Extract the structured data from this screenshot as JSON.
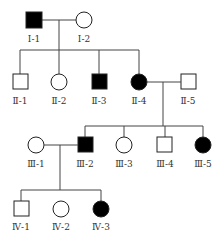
{
  "diagram": {
    "type": "pedigree",
    "colors": {
      "affected": "#000000",
      "unaffected": "#ffffff",
      "line": "#444444"
    },
    "legend": {
      "square": "male",
      "circle": "female",
      "filled": "affected",
      "open": "unaffected"
    },
    "generations": [
      {
        "id": "I",
        "members": [
          {
            "id": "I-1",
            "label": "Ⅰ-1",
            "sex": "male",
            "affected": true
          },
          {
            "id": "I-2",
            "label": "Ⅰ-2",
            "sex": "female",
            "affected": false
          }
        ]
      },
      {
        "id": "II",
        "members": [
          {
            "id": "II-1",
            "label": "Ⅱ-1",
            "sex": "male",
            "affected": false
          },
          {
            "id": "II-2",
            "label": "Ⅱ-2",
            "sex": "female",
            "affected": false
          },
          {
            "id": "II-3",
            "label": "Ⅱ-3",
            "sex": "male",
            "affected": true
          },
          {
            "id": "II-4",
            "label": "Ⅱ-4",
            "sex": "female",
            "affected": true
          },
          {
            "id": "II-5",
            "label": "Ⅱ-5",
            "sex": "male",
            "affected": false
          }
        ]
      },
      {
        "id": "III",
        "members": [
          {
            "id": "III-1",
            "label": "Ⅲ-1",
            "sex": "female",
            "affected": false
          },
          {
            "id": "III-2",
            "label": "Ⅲ-2",
            "sex": "male",
            "affected": true
          },
          {
            "id": "III-3",
            "label": "Ⅲ-3",
            "sex": "female",
            "affected": false
          },
          {
            "id": "III-4",
            "label": "Ⅲ-4",
            "sex": "male",
            "affected": false
          },
          {
            "id": "III-5",
            "label": "Ⅲ-5",
            "sex": "female",
            "affected": true
          }
        ]
      },
      {
        "id": "IV",
        "members": [
          {
            "id": "IV-1",
            "label": "Ⅳ-1",
            "sex": "male",
            "affected": false
          },
          {
            "id": "IV-2",
            "label": "Ⅳ-2",
            "sex": "female",
            "affected": false
          },
          {
            "id": "IV-3",
            "label": "Ⅳ-3",
            "sex": "female",
            "affected": true
          }
        ]
      }
    ],
    "marriages": [
      {
        "partners": [
          "I-1",
          "I-2"
        ],
        "children": [
          "II-1",
          "II-2",
          "II-3",
          "II-4"
        ]
      },
      {
        "partners": [
          "II-4",
          "II-5"
        ],
        "children": [
          "III-2",
          "III-3",
          "III-4",
          "III-5"
        ]
      },
      {
        "partners": [
          "III-1",
          "III-2"
        ],
        "children": [
          "IV-1",
          "IV-2",
          "IV-3"
        ]
      }
    ]
  }
}
